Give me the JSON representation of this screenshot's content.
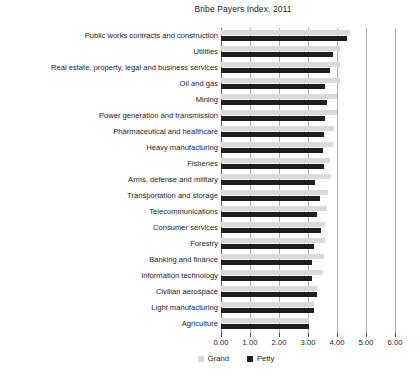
{
  "chart_data": {
    "type": "bar",
    "orientation": "horizontal",
    "title": "Bribe Payers Index, 2011",
    "xlabel": "",
    "ylabel": "",
    "xlim": [
      0,
      6
    ],
    "xticks": [
      "0.00",
      "1.00",
      "2.00",
      "3.00",
      "4.00",
      "5.00",
      "6.00"
    ],
    "xtick_values": [
      0,
      1,
      2,
      3,
      4,
      5,
      6
    ],
    "grid": true,
    "legend_position": "bottom",
    "categories": [
      "Public works contracts and construction",
      "Utilities",
      "Real estate, property, legal and business services",
      "Oil and gas",
      "Mining",
      "Power generation and transmission",
      "Pharmaceutical and healthcare",
      "Heavy manufacturing",
      "Fisheries",
      "Arms, defense and military",
      "Transportation and storage",
      "Telecommunications",
      "Consumer services",
      "Forestry",
      "Banking and finance",
      "Information technology",
      "Civilian aerospace",
      "Light manufacturing",
      "Agriculture"
    ],
    "series": [
      {
        "name": "Grand",
        "color": "#d9d9d9",
        "values": [
          4.45,
          4.1,
          4.1,
          4.1,
          4.0,
          4.0,
          3.9,
          3.85,
          3.75,
          3.8,
          3.7,
          3.65,
          3.6,
          3.6,
          3.55,
          3.5,
          3.3,
          3.2,
          3.05
        ]
      },
      {
        "name": "Petty",
        "color": "#1f1f1f",
        "values": [
          4.35,
          3.85,
          3.75,
          3.6,
          3.65,
          3.6,
          3.55,
          3.5,
          3.55,
          3.25,
          3.4,
          3.3,
          3.45,
          3.2,
          3.15,
          3.15,
          3.3,
          3.2,
          3.05
        ]
      }
    ]
  },
  "legend": {
    "items": [
      {
        "label": "Grand"
      },
      {
        "label": "Petty"
      }
    ]
  }
}
